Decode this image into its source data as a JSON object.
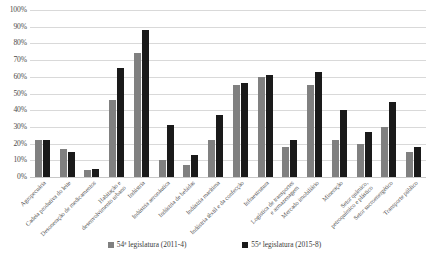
{
  "chart_data": {
    "type": "bar",
    "title": "",
    "subtitle": "",
    "xlabel": "",
    "ylabel": "",
    "ylim": [
      0,
      100
    ],
    "grid": true,
    "legend_position": "bottom",
    "y_ticks": [
      "0%",
      "10%",
      "20%",
      "30%",
      "40%",
      "50%",
      "60%",
      "70%",
      "80%",
      "90%",
      "100%"
    ],
    "y_tick_values": [
      0,
      10,
      20,
      30,
      40,
      50,
      60,
      70,
      80,
      90,
      100
    ],
    "categories": [
      "Agropecuária",
      "Cadeia produtiva do leite",
      "Desoneração de medicamentos",
      "Habitação e desenvolvimento urbano",
      "Indústria",
      "Indústria aeronáutica",
      "Indústria de bebidas",
      "Indústria marítima",
      "Indústria têxtil e da confecção",
      "Infraestrutura",
      "Logística de transportes e armazenagem",
      "Mercado imobiliário",
      "Mineração",
      "Setor químico, petroquímico e plástico",
      "Setor sucroenergético",
      "Transporte público"
    ],
    "categories_lines": [
      [
        "Agropecuária",
        ""
      ],
      [
        "Cadeia produtiva do leite",
        ""
      ],
      [
        "Desoneração de medicamentos",
        ""
      ],
      [
        "Habitação e",
        "desenvolvimento urbano"
      ],
      [
        "Indústria",
        ""
      ],
      [
        "Indústria aeronáutica",
        ""
      ],
      [
        "Indústria de bebidas",
        ""
      ],
      [
        "Indústria marítima",
        ""
      ],
      [
        "Indústria têxtil e da confecção",
        ""
      ],
      [
        "Infraestrutura",
        ""
      ],
      [
        "Logística de transportes",
        "e armazenagem"
      ],
      [
        "Mercado imobiliário",
        ""
      ],
      [
        "Mineração",
        ""
      ],
      [
        "Setor químico,",
        "petroquímico e plástico"
      ],
      [
        "Setor sucroenergético",
        ""
      ],
      [
        "Transporte público",
        ""
      ]
    ],
    "series": [
      {
        "name": "54ª legislatura (2011-4)",
        "color": "#808080",
        "values": [
          22,
          17,
          4,
          46,
          74,
          10,
          7,
          22,
          55,
          60,
          18,
          55,
          22,
          20,
          30,
          15
        ]
      },
      {
        "name": "55ª legislatura (2015-8)",
        "color": "#1a1a1a",
        "values": [
          22,
          15,
          5,
          65,
          88,
          31,
          13,
          37,
          56,
          61,
          22,
          63,
          40,
          27,
          45,
          18
        ]
      }
    ]
  },
  "legend": {
    "items": [
      {
        "label": "54ª legislatura (2011-4)",
        "color": "#808080"
      },
      {
        "label": "55ª legislatura (2015-8)",
        "color": "#1a1a1a"
      }
    ]
  },
  "colors": {
    "series_54": "#808080",
    "series_55": "#1a1a1a",
    "gridline": "#d9d9d9",
    "background": "#ffffff",
    "text": "#3a3a3a"
  }
}
